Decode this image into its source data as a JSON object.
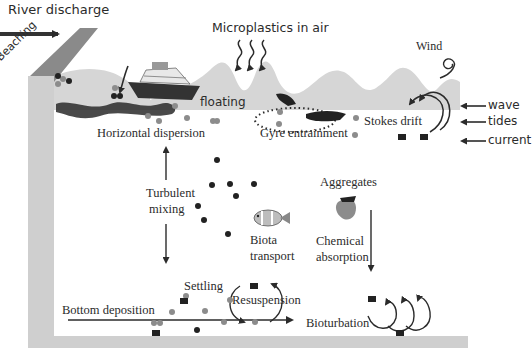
{
  "colors": {
    "sea_surface_wave": "#d6d6d6",
    "container_wall": "#cfcfcf",
    "river_bank": "#8a8a8a",
    "water": "#ffffff",
    "particle_grey": "#8c8c8c",
    "particle_dark": "#222222",
    "text": "#2b2b2b"
  },
  "labels": {
    "river_discharge": "River discharge",
    "beaching": "Beaching",
    "microplastics_in_air": "Microplastics in air",
    "wind": "Wind",
    "floating": "floating",
    "wave": "wave",
    "tides": "tides",
    "current": "current",
    "horizontal_dispersion": "Horizontal dispersion",
    "gyre_entrainment": "Gyre entrainment",
    "stokes_drift": "Stokes drift",
    "turbulent_mixing_line1": "Turbulent",
    "turbulent_mixing_line2": "mixing",
    "aggregates": "Aggregates",
    "biota_transport_line1": "Biota",
    "biota_transport_line2": "transport",
    "chemical_absorption_line1": "Chemical",
    "chemical_absorption_line2": "absorption",
    "settling": "Settling",
    "resuspension": "Resuspension",
    "bottom_deposition": "Bottom deposition",
    "bioturbation": "Bioturbation"
  },
  "icons": {
    "ship": "cruise-ship-icon",
    "fish": "clownfish-icon",
    "wind_swirl": "wind-swirl-icon"
  }
}
